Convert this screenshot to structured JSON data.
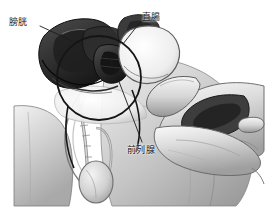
{
  "figure": {
    "width": 265,
    "height": 224,
    "style": "grayscale-halftone-illustration",
    "background_color": "#ffffff"
  },
  "labels": [
    {
      "id": "bladder",
      "text": "膀胱",
      "meaning": "bladder",
      "position": "upper-left",
      "leader_line": {
        "from_x": 40,
        "from_y": 26,
        "to_x": 72,
        "to_y": 41
      }
    },
    {
      "id": "rectum",
      "text": "直腸",
      "meaning": "rectum",
      "position": "upper-right",
      "leader_line": {
        "from_x": 141,
        "from_y": 21,
        "to_x": 123,
        "to_y": 44
      }
    },
    {
      "id": "prostate",
      "text": "前列腺",
      "meaning": "prostate",
      "position": "bottom-center",
      "leader_line": {
        "from_x": 142,
        "from_y": 142,
        "to_x": 110,
        "to_y": 58
      }
    }
  ],
  "annotations": {
    "magnifier_circle": {
      "shape": "circle-outline",
      "center_x": 99,
      "center_y": 78,
      "radius": 42,
      "stroke_color": "#151515"
    }
  },
  "anatomy_elements": [
    {
      "name": "bladder",
      "tone": "dark-gray"
    },
    {
      "name": "rectum",
      "tone": "mid-gray"
    },
    {
      "name": "prostate",
      "tone": "dark-gray"
    },
    {
      "name": "pubic-bone",
      "tone": "light-gray"
    },
    {
      "name": "sacrum-spine",
      "tone": "light-gray"
    },
    {
      "name": "penis-shaft",
      "tone": "light-gray"
    },
    {
      "name": "testis",
      "tone": "light-gray"
    },
    {
      "name": "thigh",
      "tone": "light-gray"
    },
    {
      "name": "examining-hand",
      "tone": "light-gray"
    },
    {
      "name": "index-finger",
      "tone": "light-gray"
    }
  ],
  "colors": {
    "ink": "#1b1b1b",
    "dark_tissue": "#3a3a3a",
    "mid_tissue": "#8d8d8d",
    "light_tissue": "#c8c8c8",
    "pale_tissue": "#e2e2e2",
    "background": "#ffffff"
  }
}
